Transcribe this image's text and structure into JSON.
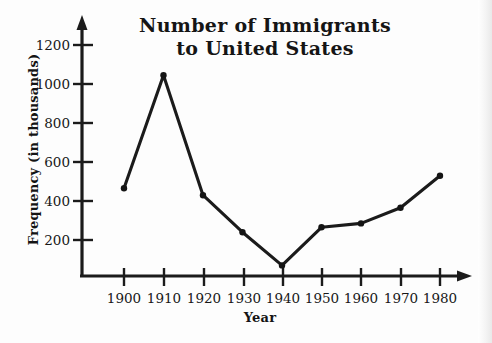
{
  "chart_data": {
    "type": "line",
    "title": "Number of Immigrants to United States",
    "title_lines": [
      "Number of Immigrants",
      "to United States"
    ],
    "xlabel": "Year",
    "ylabel": "Frequency (in thousands)",
    "categories": [
      1900,
      1910,
      1920,
      1930,
      1940,
      1950,
      1960,
      1970,
      1980
    ],
    "x_tick_labels": [
      "1900",
      "1910",
      "1920",
      "1930",
      "1940",
      "1950",
      "1960",
      "1970",
      "1980"
    ],
    "values": [
      465,
      1045,
      430,
      240,
      70,
      265,
      285,
      365,
      530
    ],
    "y_tick_labels": [
      "200",
      "400",
      "600",
      "800",
      "1000",
      "1200"
    ],
    "y_ticks": [
      200,
      400,
      600,
      800,
      1000,
      1200
    ],
    "ylim": [
      0,
      1300
    ],
    "xlim": [
      1895,
      1985
    ],
    "grid": false,
    "legend": null,
    "series_color": "#1b1b1b",
    "axis_color": "#1b1b1b",
    "background_color": "#fdfdfd",
    "marker": "round-dot"
  },
  "axes": {
    "y_axis_name": "y-axis",
    "x_axis_name": "x-axis",
    "arrow_style": "filled-triangle"
  }
}
